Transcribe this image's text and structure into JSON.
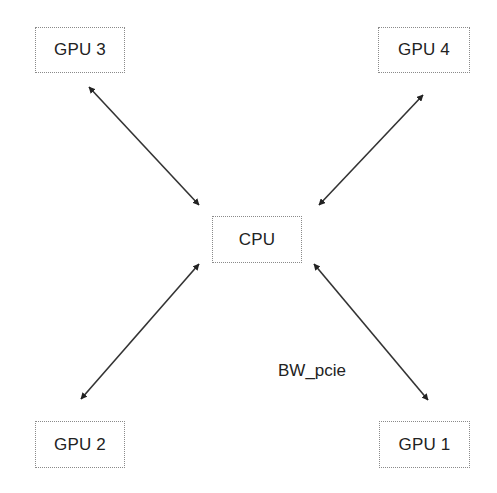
{
  "diagram": {
    "type": "star-topology",
    "nodes": [
      {
        "id": "cpu",
        "label": "CPU",
        "x": 212,
        "y": 216,
        "w": 90,
        "h": 47
      },
      {
        "id": "gpu1",
        "label": "GPU 1",
        "x": 379,
        "y": 421,
        "w": 91,
        "h": 47
      },
      {
        "id": "gpu2",
        "label": "GPU 2",
        "x": 35,
        "y": 421,
        "w": 90,
        "h": 47
      },
      {
        "id": "gpu3",
        "label": "GPU 3",
        "x": 35,
        "y": 27,
        "w": 90,
        "h": 46
      },
      {
        "id": "gpu4",
        "label": "GPU 4",
        "x": 378,
        "y": 27,
        "w": 92,
        "h": 46
      }
    ],
    "edges": [
      {
        "from": "gpu3",
        "to": "cpu",
        "direction": "bidirectional",
        "x1": 89,
        "y1": 87,
        "x2": 199,
        "y2": 205
      },
      {
        "from": "gpu4",
        "to": "cpu",
        "direction": "bidirectional",
        "x1": 423,
        "y1": 95,
        "x2": 319,
        "y2": 205
      },
      {
        "from": "gpu2",
        "to": "cpu",
        "direction": "bidirectional",
        "x1": 81,
        "y1": 399,
        "x2": 199,
        "y2": 264
      },
      {
        "from": "gpu1",
        "to": "cpu",
        "direction": "bidirectional",
        "x1": 428,
        "y1": 400,
        "x2": 314,
        "y2": 264,
        "label": "BW_pcie"
      }
    ],
    "edge_label": {
      "text": "BW_pcie",
      "x": 278,
      "y": 361
    }
  },
  "colors": {
    "line": "#333333",
    "node_border": "#8a8a8a",
    "text": "#222222",
    "background": "#ffffff"
  }
}
